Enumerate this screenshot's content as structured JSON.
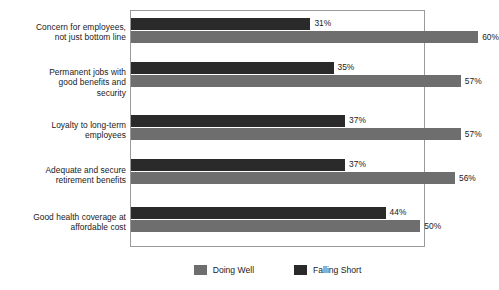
{
  "chart_data": {
    "type": "bar",
    "orientation": "horizontal",
    "title": "",
    "xlabel": "",
    "ylabel": "",
    "xlim": [
      0,
      100
    ],
    "grid": false,
    "legend_position": "bottom",
    "value_suffix": "%",
    "categories": [
      "Concern for employees, not just bottom line",
      "Permanent jobs with good benefits and security",
      "Loyalty to long-term employees",
      "Adequate and secure retirement benefits",
      "Good health coverage at affordable cost"
    ],
    "category_lines": [
      [
        "Concern for employees,",
        "not just bottom line"
      ],
      [
        "Permanent jobs with",
        "good benefits and",
        "security"
      ],
      [
        "Loyalty to long-term",
        "employees"
      ],
      [
        "Adequate and secure",
        "retirement benefits"
      ],
      [
        "Good health coverage at",
        "affordable cost"
      ]
    ],
    "series": [
      {
        "name": "Falling Short",
        "color": "#2a2a2a",
        "values": [
          31,
          35,
          37,
          37,
          44
        ]
      },
      {
        "name": "Doing Well",
        "color": "#6e6e6e",
        "values": [
          60,
          57,
          57,
          56,
          50
        ]
      }
    ],
    "value_labels": {
      "falling_short": [
        "31%",
        "35%",
        "37%",
        "37%",
        "44%"
      ],
      "doing_well": [
        "60%",
        "57%",
        "57%",
        "56%",
        "50%"
      ]
    }
  },
  "legend": {
    "items": [
      {
        "label": "Doing Well",
        "color": "#6e6e6e"
      },
      {
        "label": "Falling Short",
        "color": "#2a2a2a"
      }
    ]
  }
}
